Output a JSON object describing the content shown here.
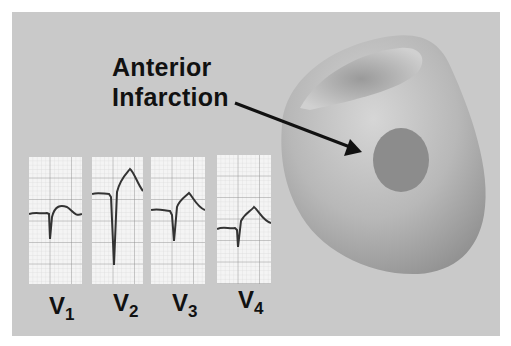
{
  "title": {
    "line1": "Anterior",
    "line2": "Infarction"
  },
  "colors": {
    "background": "#c9c9c9",
    "heart": "#b5b5b5",
    "infarct": "#8c8c8c",
    "text": "#111111",
    "grid_paper": "#f4f4f4"
  },
  "leads": [
    {
      "name": "V",
      "sub": "1"
    },
    {
      "name": "V",
      "sub": "2"
    },
    {
      "name": "V",
      "sub": "3"
    },
    {
      "name": "V",
      "sub": "4"
    }
  ],
  "annotation": {
    "arrow_target": "anterior-wall-infarct-zone"
  }
}
